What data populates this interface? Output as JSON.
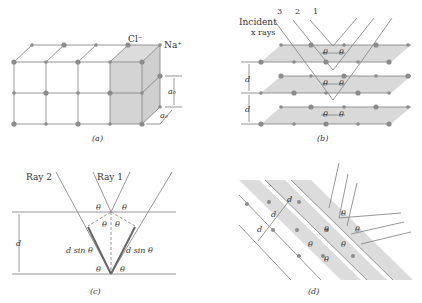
{
  "panels": {
    "a": {
      "caption": "(a)",
      "labels": {
        "anion": "Cl⁻",
        "cation": "Na⁺",
        "spacing1": "a₀",
        "spacing2": "a₀"
      }
    },
    "b": {
      "caption": "(b)",
      "incident_label_1": "Incident",
      "incident_label_2": "x rays",
      "ray_numbers": [
        "3",
        "2",
        "1"
      ],
      "angle": "θ",
      "spacing": "d"
    },
    "c": {
      "caption": "(c)",
      "ray2": "Ray 2",
      "ray1": "Ray 1",
      "angle": "θ",
      "spacing": "d",
      "path_diff": "d sin θ"
    },
    "d": {
      "caption": "(d)",
      "angle": "θ",
      "spacing": "d"
    }
  },
  "colors": {
    "line": "#8a8a8a",
    "dot": "#8c8c8c",
    "plane": "#d9d9d9",
    "cube_face": "#d4d4d4",
    "ray": "#8a8a8a",
    "text": "#333333"
  }
}
